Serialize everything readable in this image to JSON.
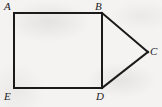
{
  "figure": {
    "kind": "geometry-diagram",
    "background_color": "#f4f3f1",
    "stroke_color": "#1a1a1a",
    "stroke_width": 2,
    "width": 162,
    "height": 107,
    "vertices": [
      {
        "id": "A",
        "label": "A",
        "x": 14,
        "y": 13,
        "label_x": 4,
        "label_y": 1
      },
      {
        "id": "B",
        "label": "B",
        "x": 102,
        "y": 13,
        "label_x": 95,
        "label_y": 1
      },
      {
        "id": "C",
        "label": "C",
        "x": 148,
        "y": 52,
        "label_x": 150,
        "label_y": 46
      },
      {
        "id": "D",
        "label": "D",
        "x": 102,
        "y": 88,
        "label_x": 96,
        "label_y": 91
      },
      {
        "id": "E",
        "label": "E",
        "x": 14,
        "y": 88,
        "label_x": 4,
        "label_y": 91
      }
    ],
    "edges": [
      {
        "id": "AB",
        "from": "A",
        "to": "B",
        "x1": 14,
        "y1": 13,
        "x2": 102,
        "y2": 13
      },
      {
        "id": "BC",
        "from": "B",
        "to": "C",
        "x1": 102,
        "y1": 13,
        "x2": 148,
        "y2": 52
      },
      {
        "id": "CD",
        "from": "C",
        "to": "D",
        "x1": 148,
        "y1": 52,
        "x2": 102,
        "y2": 88
      },
      {
        "id": "DE",
        "from": "D",
        "to": "E",
        "x1": 102,
        "y1": 88,
        "x2": 14,
        "y2": 88
      },
      {
        "id": "EA",
        "from": "E",
        "to": "A",
        "x1": 14,
        "y1": 88,
        "x2": 14,
        "y2": 13
      },
      {
        "id": "BD",
        "from": "B",
        "to": "D",
        "x1": 102,
        "y1": 13,
        "x2": 102,
        "y2": 88
      }
    ]
  }
}
